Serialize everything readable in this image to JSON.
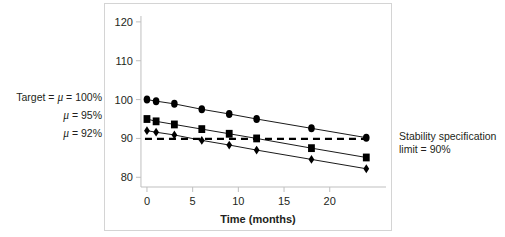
{
  "figure": {
    "name": "stability-degradation-chart",
    "left_annotations": [
      {
        "id": "target-100",
        "text": "Target = ",
        "mu": "μ",
        "tail": " = 100%"
      },
      {
        "id": "mu-95",
        "text": "",
        "mu": "μ",
        "tail": " = 95%"
      },
      {
        "id": "mu-92",
        "text": "",
        "mu": "μ",
        "tail": " = 92%"
      }
    ],
    "right_annotation": {
      "line1": "Stability specification",
      "line2": "limit = 90%"
    }
  },
  "chart_data": {
    "type": "line",
    "title": "",
    "xlabel": "Time (months)",
    "ylabel": "",
    "xlim": [
      -1.2,
      25.5
    ],
    "ylim": [
      77.5,
      121
    ],
    "xticks": [
      0,
      5,
      10,
      15,
      20
    ],
    "yticks": [
      80,
      90,
      100,
      110,
      120
    ],
    "xtick_labels": [
      "0",
      "5",
      "10",
      "15",
      "20"
    ],
    "ytick_labels": [
      "80",
      "90",
      "100",
      "110",
      "120"
    ],
    "grid": false,
    "legend": "none",
    "x": [
      0,
      1,
      3,
      6,
      9,
      12,
      18,
      24
    ],
    "series": [
      {
        "name": "Target = μ = 100%",
        "marker": "circle",
        "color": "#000000",
        "values": [
          100.0,
          99.6,
          98.9,
          97.5,
          96.3,
          95.0,
          92.6,
          90.2
        ]
      },
      {
        "name": "μ = 95%",
        "marker": "square",
        "color": "#000000",
        "values": [
          95.0,
          94.4,
          93.6,
          92.4,
          91.2,
          90.0,
          87.5,
          85.1
        ]
      },
      {
        "name": "μ = 92%",
        "marker": "diamond",
        "color": "#000000",
        "values": [
          92.0,
          91.6,
          90.9,
          89.5,
          88.3,
          87.0,
          84.6,
          82.2
        ]
      }
    ],
    "reference_lines": [
      {
        "name": "Stability specification limit = 90%",
        "orientation": "horizontal",
        "value": 90,
        "style": "dashed",
        "color": "#000000"
      }
    ]
  }
}
